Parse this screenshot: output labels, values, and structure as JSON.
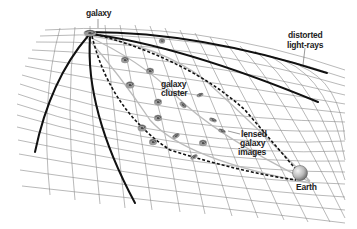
{
  "diagram": {
    "labels": {
      "galaxy": "galaxy",
      "distorted_line1": "distorted",
      "distorted_line2": "light-rays",
      "cluster_line1": "galaxy",
      "cluster_line2": "cluster",
      "lensed_line1": "lensed",
      "lensed_line2": "galaxy",
      "lensed_line3": "images",
      "earth": "Earth"
    },
    "elements": {
      "source_galaxy": "spiral-galaxy-icon",
      "cluster_galaxies": "spiral-galaxy-icon",
      "earth": "sphere-icon",
      "spacetime_grid": "warped-grid",
      "light_rays": "solid-curves",
      "lensed_paths": "dashed-curves"
    },
    "colors": {
      "grid": "#8a8a8a",
      "rays": "#111111",
      "background": "#ffffff",
      "earth": "#bdbdbd"
    }
  }
}
